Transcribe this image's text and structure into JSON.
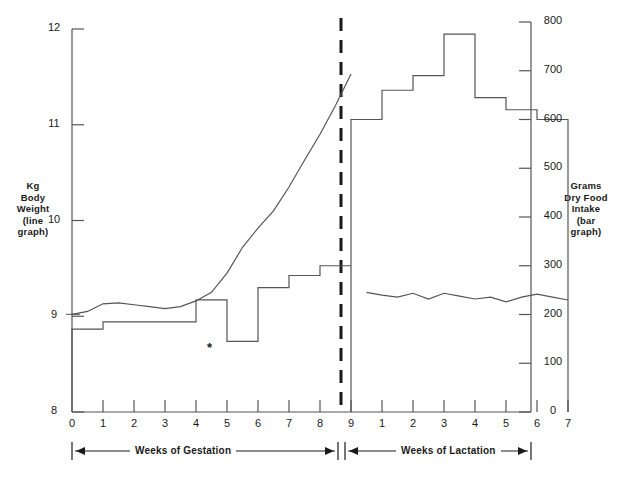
{
  "figure": {
    "left_axis_title_lines": [
      "Kg",
      "Body",
      "Weight",
      "(line",
      "graph)"
    ],
    "right_axis_title_lines": [
      "Grams",
      "Dry Food",
      "Intake",
      "(bar",
      "graph)"
    ],
    "band_left_label": "Weeks of Gestation",
    "band_right_label": "Weeks of Lactation",
    "annotation_marker": "*"
  },
  "chart_data": {
    "type": "line",
    "title": "",
    "xlabel": "",
    "ylabel": "Kg Body Weight (line graph)",
    "y2label": "Grams Dry Food Intake (bar graph)",
    "grid": false,
    "legend": "none",
    "ylim": [
      8,
      12
    ],
    "y2lim": [
      0,
      800
    ],
    "yticks": [
      8,
      9,
      10,
      11,
      12
    ],
    "y2ticks": [
      0,
      100,
      200,
      300,
      400,
      500,
      600,
      700,
      800
    ],
    "xticks_gestation": [
      0,
      1,
      2,
      3,
      4,
      5,
      6,
      7,
      8,
      9
    ],
    "xticks_lactation": [
      1,
      2,
      3,
      4,
      5,
      6,
      7
    ],
    "phase_divider_at": "week 9 (end of gestation)",
    "series": [
      {
        "name": "Body Weight (kg)",
        "type": "line",
        "axis": "left",
        "x": [
          0,
          0.5,
          1,
          1.5,
          2,
          2.5,
          3,
          3.5,
          4,
          4.5,
          5,
          5.5,
          6,
          6.5,
          7,
          7.5,
          8,
          8.5,
          9,
          9.5,
          10,
          10.5,
          11,
          11.5,
          12,
          12.5,
          13,
          13.5,
          14,
          14.5,
          15,
          15.5,
          16
        ],
        "values": [
          9.02,
          9.05,
          9.13,
          9.14,
          9.12,
          9.1,
          9.08,
          9.1,
          9.16,
          9.25,
          9.45,
          9.72,
          9.92,
          10.1,
          10.35,
          10.63,
          10.9,
          11.2,
          11.53,
          9.25,
          9.22,
          9.2,
          9.24,
          9.18,
          9.24,
          9.21,
          9.18,
          9.2,
          9.15,
          9.2,
          9.23,
          9.2,
          9.17
        ]
      },
      {
        "name": "Dry Food Intake (g) - Gestation",
        "type": "bar",
        "axis": "right",
        "categories": [
          1,
          2,
          3,
          4,
          5,
          6,
          7,
          8,
          9
        ],
        "values": [
          170,
          185,
          185,
          185,
          230,
          145,
          255,
          280,
          300,
          300
        ]
      },
      {
        "name": "Dry Food Intake (g) - Lactation",
        "type": "bar",
        "axis": "right",
        "categories": [
          1,
          2,
          3,
          4,
          5,
          6,
          7
        ],
        "values": [
          600,
          660,
          690,
          775,
          645,
          620,
          600
        ]
      }
    ],
    "annotations": [
      {
        "text": "*",
        "x": "gestation week 4-5",
        "note": "marks reduced intake bar"
      }
    ]
  },
  "colors": {
    "ink": "#1a1a1a",
    "line": "#555555",
    "background": "#ffffff"
  }
}
